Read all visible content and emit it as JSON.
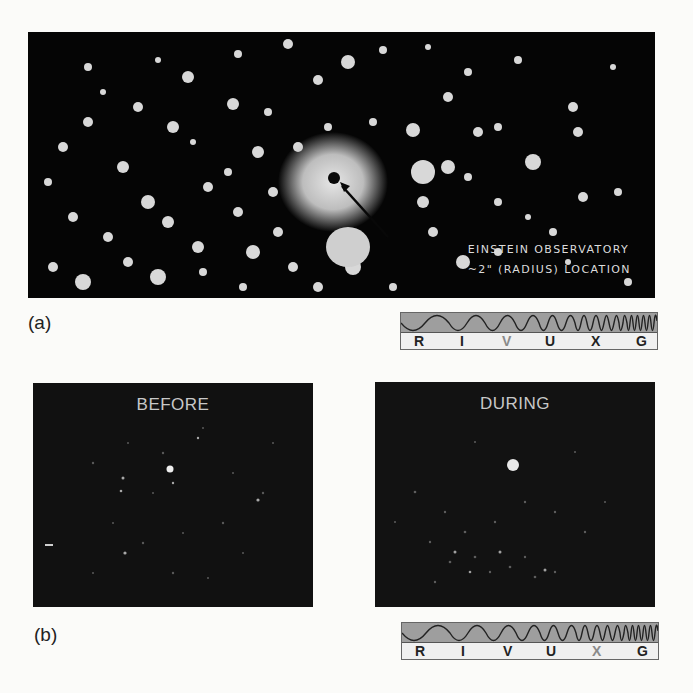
{
  "figure_a": {
    "label": "(a)",
    "image": {
      "description": "optical image of dense star cluster with marked X-ray source location",
      "annotation_line1": "EINSTEIN OBSERVATORY",
      "annotation_line2": "~2\" (RADIUS) LOCATION"
    },
    "band_indicator": {
      "letters": [
        "R",
        "I",
        "V",
        "U",
        "X",
        "G"
      ],
      "highlighted": "V"
    }
  },
  "figure_b": {
    "label": "(b)",
    "panels": [
      {
        "title": "BEFORE"
      },
      {
        "title": "DURING"
      }
    ],
    "band_indicator": {
      "letters": [
        "R",
        "I",
        "V",
        "U",
        "X",
        "G"
      ],
      "highlighted": "X"
    }
  },
  "colors": {
    "background": "#fbfbf9",
    "image_black": "#050505",
    "band_wave_fill": "#9e9e9e",
    "band_letter_fill": "#f0f0f0",
    "highlight_letter": "#8a8a8a"
  }
}
